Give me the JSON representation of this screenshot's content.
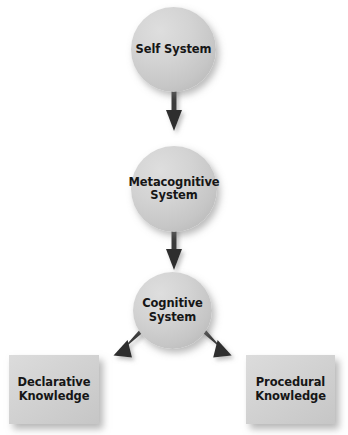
{
  "diagram": {
    "type": "flow-diagram",
    "background_color": "#ffffff",
    "node_fill_color": "#d2d2d2",
    "connector_color": "#3a3a3a",
    "label_color": "#161616",
    "nodes": [
      {
        "id": "self-system",
        "shape": "circle",
        "label": "Self System"
      },
      {
        "id": "metacognitive-system",
        "shape": "circle",
        "label": "Metacognitive\nSystem"
      },
      {
        "id": "cognitive-system",
        "shape": "circle",
        "label": "Cognitive\nSystem"
      },
      {
        "id": "declarative-knowledge",
        "shape": "rectangle",
        "label": "Declarative\nKnowledge"
      },
      {
        "id": "procedural-knowledge",
        "shape": "rectangle",
        "label": "Procedural\nKnowledge"
      }
    ],
    "connectors": [
      {
        "id": "self-to-metacognitive",
        "from": "self-system",
        "to": "metacognitive-system",
        "direction": "down",
        "arrowhead": "end"
      },
      {
        "id": "metacognitive-to-cognitive",
        "from": "metacognitive-system",
        "to": "cognitive-system",
        "direction": "down",
        "arrowhead": "end"
      },
      {
        "id": "cognitive-to-declarative",
        "from": "cognitive-system",
        "to": "declarative-knowledge",
        "direction": "down-left",
        "arrowhead": "end"
      },
      {
        "id": "cognitive-to-procedural",
        "from": "cognitive-system",
        "to": "procedural-knowledge",
        "direction": "down-right",
        "arrowhead": "end"
      }
    ]
  }
}
